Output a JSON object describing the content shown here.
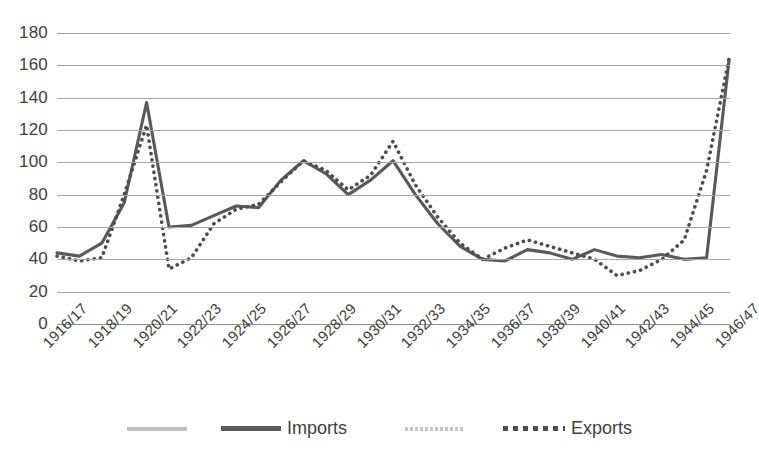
{
  "chart_data": {
    "type": "line",
    "title": "",
    "subtitle": "",
    "xlabel": "",
    "ylabel": "",
    "grid": true,
    "legend_position": "bottom",
    "ylim": [
      0,
      180
    ],
    "yticks": [
      0,
      20,
      40,
      60,
      80,
      100,
      120,
      140,
      160,
      180
    ],
    "ytick_labels": [
      "0",
      "20",
      "40",
      "60",
      "80",
      "100",
      "120",
      "140",
      "160",
      "180"
    ],
    "categories": [
      "1916/17",
      "1917/18",
      "1918/19",
      "1919/20",
      "1920/21",
      "1921/22",
      "1922/23",
      "1923/24",
      "1924/25",
      "1925/26",
      "1926/27",
      "1927/28",
      "1928/29",
      "1929/30",
      "1930/31",
      "1931/32",
      "1932/33",
      "1933/34",
      "1934/35",
      "1935/36",
      "1936/37",
      "1937/38",
      "1938/39",
      "1939/40",
      "1940/41",
      "1941/42",
      "1942/43",
      "1943/44",
      "1944/45",
      "1945/46",
      "1946/47"
    ],
    "xtick_labels": [
      "1916/17",
      "1918/19",
      "1920/21",
      "1922/23",
      "1924/25",
      "1926/27",
      "1928/29",
      "1930/31",
      "1932/33",
      "1934/35",
      "1936/37",
      "1938/39",
      "1940/41",
      "1942/43",
      "1944/45",
      "1946/47"
    ],
    "xtick_step": 2,
    "series": [
      {
        "name": "Imports",
        "style": "solid",
        "color": "#595959",
        "values": [
          44,
          42,
          50,
          72,
          98,
          137,
          60,
          60,
          66,
          73,
          72,
          88,
          101,
          99,
          87,
          80,
          95,
          101,
          80,
          62,
          48,
          40,
          39,
          44,
          46,
          42,
          40,
          45,
          42,
          43,
          43
        ]
      },
      {
        "name": "Exports",
        "style": "dotted",
        "color": "#4d4d4d",
        "values": [
          42,
          39,
          41,
          80,
          123,
          110,
          100,
          34,
          41,
          60,
          70,
          74,
          87,
          101,
          95,
          83,
          92,
          113,
          86,
          66,
          50,
          40,
          47,
          52,
          48,
          44,
          40,
          49,
          48,
          37,
          35
        ]
      }
    ],
    "series_full": {
      "note": "values continue across all 31 category points; see imports_all / exports_all",
      "imports_all": [
        44,
        42,
        50,
        72,
        98,
        137,
        60,
        60,
        66,
        73,
        72,
        88,
        101,
        99,
        87,
        80,
        95,
        101,
        80,
        62,
        48,
        40,
        39,
        44,
        46,
        42,
        40,
        45,
        42,
        43,
        40,
        40,
        41,
        52,
        58,
        84,
        67,
        84,
        120,
        163
      ],
      "exports_all": [
        42,
        39,
        41,
        80,
        123,
        110,
        100,
        34,
        41,
        60,
        70,
        74,
        87,
        101,
        95,
        83,
        92,
        113,
        86,
        66,
        50,
        40,
        47,
        52,
        48,
        44,
        40,
        49,
        48,
        37,
        30,
        29,
        33,
        40,
        52,
        84,
        95,
        115,
        148,
        164
      ]
    },
    "points": {
      "imports": [
        {
          "x": "1916/17",
          "y": 44
        },
        {
          "x": "1917/18",
          "y": 42
        },
        {
          "x": "1918/19",
          "y": 50
        },
        {
          "x": "1919/20",
          "y": 75
        },
        {
          "x": "1920/21",
          "y": 137
        },
        {
          "x": "1921/22",
          "y": 60
        },
        {
          "x": "1922/23",
          "y": 61
        },
        {
          "x": "1923/24",
          "y": 67
        },
        {
          "x": "1924/25",
          "y": 73
        },
        {
          "x": "1925/26",
          "y": 72
        },
        {
          "x": "1926/27",
          "y": 89
        },
        {
          "x": "1927/28",
          "y": 101
        },
        {
          "x": "1928/29",
          "y": 93
        },
        {
          "x": "1929/30",
          "y": 80
        },
        {
          "x": "1930/31",
          "y": 89
        },
        {
          "x": "1931/32",
          "y": 101
        },
        {
          "x": "1932/33",
          "y": 80
        },
        {
          "x": "1933/34",
          "y": 62
        },
        {
          "x": "1934/35",
          "y": 48
        },
        {
          "x": "1935/36",
          "y": 40
        },
        {
          "x": "1936/37",
          "y": 39
        },
        {
          "x": "1937/38",
          "y": 46
        },
        {
          "x": "1938/39",
          "y": 44
        },
        {
          "x": "1939/40",
          "y": 40
        },
        {
          "x": "1940/41",
          "y": 46
        },
        {
          "x": "1941/42",
          "y": 42
        },
        {
          "x": "1942/43",
          "y": 41
        },
        {
          "x": "1943/44",
          "y": 43
        },
        {
          "x": "1944/45",
          "y": 40
        },
        {
          "x": "1945/46",
          "y": 41
        },
        {
          "x": "1946/47",
          "y": 163
        }
      ],
      "exports": [
        {
          "x": "1916/17",
          "y": 42
        },
        {
          "x": "1917/18",
          "y": 39
        },
        {
          "x": "1918/19",
          "y": 41
        },
        {
          "x": "1919/20",
          "y": 80
        },
        {
          "x": "1920/21",
          "y": 123
        },
        {
          "x": "1921/22",
          "y": 34
        },
        {
          "x": "1922/23",
          "y": 41
        },
        {
          "x": "1923/24",
          "y": 62
        },
        {
          "x": "1924/25",
          "y": 71
        },
        {
          "x": "1925/26",
          "y": 74
        },
        {
          "x": "1926/27",
          "y": 88
        },
        {
          "x": "1927/28",
          "y": 101
        },
        {
          "x": "1928/29",
          "y": 95
        },
        {
          "x": "1929/30",
          "y": 83
        },
        {
          "x": "1930/31",
          "y": 92
        },
        {
          "x": "1931/32",
          "y": 113
        },
        {
          "x": "1932/33",
          "y": 86
        },
        {
          "x": "1933/34",
          "y": 66
        },
        {
          "x": "1934/35",
          "y": 50
        },
        {
          "x": "1935/36",
          "y": 40
        },
        {
          "x": "1936/37",
          "y": 47
        },
        {
          "x": "1937/38",
          "y": 52
        },
        {
          "x": "1938/39",
          "y": 48
        },
        {
          "x": "1939/40",
          "y": 44
        },
        {
          "x": "1940/41",
          "y": 40
        },
        {
          "x": "1941/42",
          "y": 30
        },
        {
          "x": "1942/43",
          "y": 33
        },
        {
          "x": "1943/44",
          "y": 40
        },
        {
          "x": "1944/45",
          "y": 52
        },
        {
          "x": "1945/46",
          "y": 95
        },
        {
          "x": "1946/47",
          "y": 164
        }
      ]
    }
  },
  "legend": {
    "items": [
      {
        "label": "Imports",
        "swatch": "solid-line-swatch"
      },
      {
        "label": "Exports",
        "swatch": "dotted-line-swatch"
      }
    ],
    "imports_label": "Imports",
    "exports_label": "Exports"
  },
  "colors": {
    "imports_line": "#595959",
    "exports_line": "#4d4d4d",
    "gridline": "#a6a6a6",
    "tick_text": "#404040",
    "background": "#ffffff"
  }
}
